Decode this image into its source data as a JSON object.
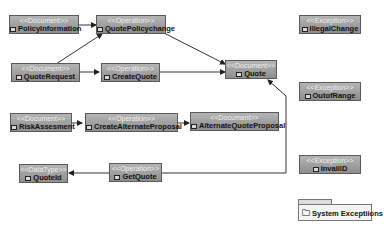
{
  "diagram": {
    "nodes": [
      {
        "id": "policy_information",
        "stereotype": "<<Document>>",
        "name": "PolicyInformation"
      },
      {
        "id": "quote_policy_change",
        "stereotype": "<<Operation>>",
        "name": "QuotePolicychange"
      },
      {
        "id": "quote_request",
        "stereotype": "<<Document>>",
        "name": "QuoteRequest"
      },
      {
        "id": "create_quote",
        "stereotype": "<<Operation>>",
        "name": "CreateQuote"
      },
      {
        "id": "quote",
        "stereotype": "<<Document>>",
        "name": "Quote"
      },
      {
        "id": "risk_assesment",
        "stereotype": "<<Document>>",
        "name": "RiskAssesment"
      },
      {
        "id": "create_alternate_proposal",
        "stereotype": "<<Operation>>",
        "name": "CreateAlternateProposal"
      },
      {
        "id": "alternate_quote_proposal",
        "stereotype": "<<Document>>",
        "name": "AlternateQuoteProposal"
      },
      {
        "id": "quote_id",
        "stereotype": "<<DataType>>",
        "name": "QuoteId"
      },
      {
        "id": "get_quote",
        "stereotype": "<<Operation>>",
        "name": "GetQuote"
      },
      {
        "id": "illegal_change",
        "stereotype": "<<Exception>>",
        "name": "IllegalChange"
      },
      {
        "id": "out_of_range",
        "stereotype": "<<Exception>>",
        "name": "OutofRange"
      },
      {
        "id": "invalid_id",
        "stereotype": "<<Exception>>",
        "name": "InvalilD"
      }
    ],
    "package": {
      "name": "System Exceptiions"
    },
    "edges": [
      {
        "from": "PolicyInformation",
        "to": "QuotePolicychange"
      },
      {
        "from": "QuoteRequest",
        "to": "QuotePolicychange"
      },
      {
        "from": "QuoteRequest",
        "to": "CreateQuote"
      },
      {
        "from": "QuotePolicychange",
        "to": "Quote"
      },
      {
        "from": "CreateQuote",
        "to": "Quote"
      },
      {
        "from": "RiskAssesment",
        "to": "CreateAlternateProposal"
      },
      {
        "from": "CreateAlternateProposal",
        "to": "AlternateQuoteProposal"
      },
      {
        "from": "GetQuote",
        "to": "QuoteId"
      },
      {
        "from": "GetQuote",
        "to": "Quote"
      }
    ]
  }
}
